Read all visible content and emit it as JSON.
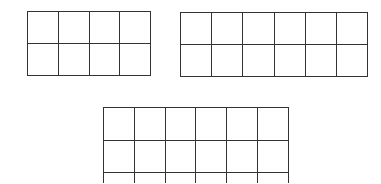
{
  "diagram": {
    "stroke_color": "#333333",
    "background": "#ffffff",
    "grids": [
      {
        "name": "grid-top-left",
        "rows": 2,
        "cols": 4,
        "x": 27,
        "y": 11,
        "cell_w": 30.75,
        "cell_h": 32,
        "cropped": false
      },
      {
        "name": "grid-top-right",
        "rows": 2,
        "cols": 6,
        "x": 180,
        "y": 12,
        "cell_w": 31.2,
        "cell_h": 32,
        "cropped": false
      },
      {
        "name": "grid-bottom-center",
        "rows": 3,
        "cols": 6,
        "x": 103,
        "y": 107,
        "cell_w": 30.8,
        "cell_h": 32.5,
        "cropped": true
      }
    ]
  }
}
